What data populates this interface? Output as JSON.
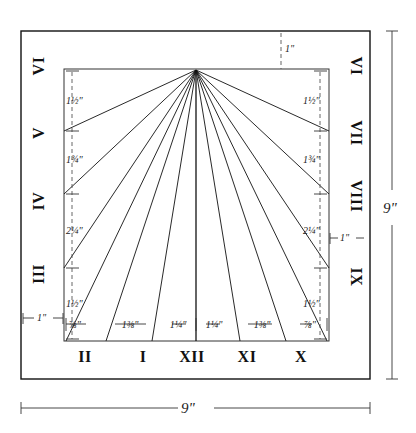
{
  "diagram": {
    "overall": {
      "width_label": "9\"",
      "height_label": "9\"",
      "margin_label_left": "1\"",
      "margin_label_right": "1\"",
      "margin_label_top": "1\""
    },
    "hour_numerals": {
      "left_column": [
        "VI",
        "V",
        "IV",
        "III"
      ],
      "right_column": [
        "VI",
        "VII",
        "VIII",
        "IX"
      ],
      "bottom_row": [
        "II",
        "I",
        "XII",
        "XI",
        "X"
      ]
    },
    "left_vertical_dims": [
      "1½\"",
      "1¾\"",
      "2¼\"",
      "1½\""
    ],
    "right_vertical_dims": [
      "1½\"",
      "1¾\"",
      "2¼\"",
      "1½\""
    ],
    "bottom_horizontal_dims": [
      "⅞\"",
      "1⅜\"",
      "1¼\"",
      "1¼\"",
      "1⅜\"",
      "⅞\""
    ],
    "left_vertical_fracs": [
      {
        "whole": "1",
        "num": "1",
        "den": "2",
        "unit": "\""
      },
      {
        "whole": "1",
        "num": "3",
        "den": "4",
        "unit": "\""
      },
      {
        "whole": "2",
        "num": "1",
        "den": "4",
        "unit": "\""
      },
      {
        "whole": "1",
        "num": "1",
        "den": "2",
        "unit": "\""
      }
    ],
    "right_vertical_fracs": [
      {
        "whole": "1",
        "num": "1",
        "den": "2",
        "unit": "\""
      },
      {
        "whole": "1",
        "num": "3",
        "den": "4",
        "unit": "\""
      },
      {
        "whole": "2",
        "num": "1",
        "den": "4",
        "unit": "\""
      },
      {
        "whole": "1",
        "num": "1",
        "den": "2",
        "unit": "\""
      }
    ],
    "bottom_fracs": [
      {
        "whole": "",
        "num": "7",
        "den": "8",
        "unit": "\""
      },
      {
        "whole": "1",
        "num": "3",
        "den": "8",
        "unit": "\""
      },
      {
        "whole": "1",
        "num": "1",
        "den": "4",
        "unit": "\""
      },
      {
        "whole": "1",
        "num": "1",
        "den": "4",
        "unit": "\""
      },
      {
        "whole": "1",
        "num": "3",
        "den": "8",
        "unit": "\""
      },
      {
        "whole": "",
        "num": "7",
        "den": "8",
        "unit": "\""
      }
    ],
    "colors": {
      "ink": "#111111",
      "paper": "#ffffff",
      "dash": "#555555"
    }
  }
}
